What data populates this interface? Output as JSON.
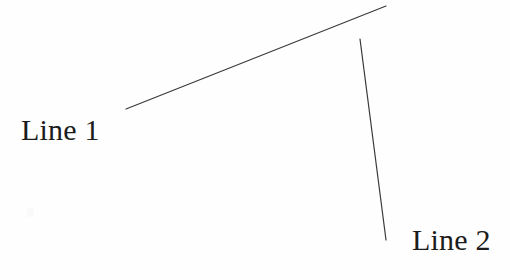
{
  "figure": {
    "background_color": "#fefefe",
    "width": 510,
    "height": 280,
    "stroke_color": "#3a3a3a",
    "label_color": "#1c1c1c",
    "labels": {
      "line_1": "Line 1",
      "line_2": "Line 2"
    },
    "lines": [
      {
        "name": "line-1",
        "label": "Line 1",
        "x1": 126,
        "y1": 109,
        "x2": 386,
        "y2": 6,
        "stroke_width": 1.2
      },
      {
        "name": "line-2",
        "label": "Line 2",
        "x1": 360,
        "y1": 39,
        "x2": 386,
        "y2": 240,
        "stroke_width": 1.2
      }
    ]
  },
  "chart_data": {
    "type": "line",
    "title": "",
    "xlabel": "",
    "ylabel": "",
    "grid": false,
    "legend": "inline-labels",
    "xlim": [
      0,
      510
    ],
    "ylim": [
      0,
      280
    ],
    "series": [
      {
        "name": "Line 1",
        "x": [
          126,
          386
        ],
        "y": [
          109,
          6
        ],
        "color": "#3a3a3a",
        "label_position": [
          21,
          115
        ]
      },
      {
        "name": "Line 2",
        "x": [
          360,
          386
        ],
        "y": [
          39,
          240
        ],
        "color": "#3a3a3a",
        "label_position": [
          412,
          225
        ]
      }
    ]
  }
}
